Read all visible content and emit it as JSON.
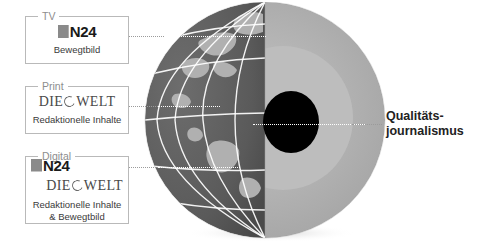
{
  "diagram": {
    "title_right": {
      "line1": "Qualitäts-",
      "line2": "journalismus"
    },
    "callouts": [
      {
        "legend": "TV",
        "logos": [
          "n24"
        ],
        "n24_text": "N24",
        "description": "Bewegtbild"
      },
      {
        "legend": "Print",
        "logos": [
          "welt"
        ],
        "welt_die": "DIE",
        "welt_welt": "WELT",
        "description": "Redaktionelle Inhalte"
      },
      {
        "legend": "Digital",
        "logos": [
          "n24",
          "welt"
        ],
        "n24_text": "N24",
        "welt_die": "DIE",
        "welt_welt": "WELT",
        "description_line1": "Redaktionelle Inhalte",
        "description_line2": "& Bewegtbild"
      }
    ],
    "graphic": {
      "name": "cutaway-globe",
      "layers": [
        {
          "name": "outer-sphere-surface",
          "color": "#5e5e5e"
        },
        {
          "name": "landmass",
          "color": "#b3b3b3"
        },
        {
          "name": "grid-lines",
          "color": "#ffffff"
        },
        {
          "name": "cut-face-outer",
          "color": "#a8a8a8"
        },
        {
          "name": "cut-face-inner",
          "color": "#bdbdbd"
        },
        {
          "name": "core",
          "color": "#000000"
        }
      ]
    },
    "colors": {
      "box_border": "#b9b9b9",
      "legend_text": "#8d8d8d",
      "body_text": "#3a3a3a",
      "leader_line": "#9b9b9b",
      "leader_line_over_globe": "#ffffff"
    }
  }
}
